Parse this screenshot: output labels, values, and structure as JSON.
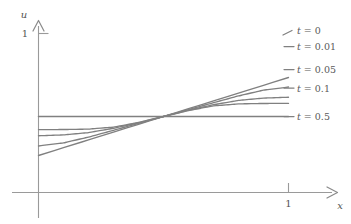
{
  "chart_data": {
    "type": "line",
    "title": "",
    "xlabel": "x",
    "ylabel": "u",
    "xlim": [
      -0.15,
      1.19
    ],
    "ylim": [
      -0.62,
      1.12
    ],
    "grid": false,
    "legend_position": "right-inline",
    "axis_style": "arrow-axes-through-origin",
    "xticks": [
      1
    ],
    "xticklabels": [
      "1"
    ],
    "yticks": [
      1
    ],
    "yticklabels": [
      "1"
    ],
    "line_color": "#808080",
    "axis_color": "#9a9a9a",
    "crossing_point": {
      "x": 0.5,
      "u": 0
    },
    "series": [
      {
        "name": "t = 0",
        "t": 0,
        "label": "t = 0",
        "label_value": "0",
        "shape": "straight-line",
        "x": [
          0.0,
          0.1,
          0.2,
          0.3,
          0.4,
          0.5,
          0.6,
          0.7,
          0.8,
          0.9,
          1.0
        ],
        "values": [
          -0.47,
          -0.375,
          -0.282,
          -0.188,
          -0.094,
          0.0,
          0.094,
          0.188,
          0.282,
          0.375,
          0.47
        ]
      },
      {
        "name": "t = 0.01",
        "t": 0.01,
        "label": "t = 0.01",
        "label_value": "0.01",
        "shape": "sigmoid",
        "x": [
          0.0,
          0.1,
          0.2,
          0.3,
          0.4,
          0.5,
          0.6,
          0.7,
          0.8,
          0.9,
          1.0
        ],
        "values": [
          -0.158,
          -0.157,
          -0.152,
          -0.128,
          -0.072,
          0.0,
          0.072,
          0.128,
          0.152,
          0.157,
          0.158
        ]
      },
      {
        "name": "t = 0.05",
        "t": 0.05,
        "label": "t = 0.05",
        "label_value": "0.05",
        "shape": "sigmoid",
        "x": [
          0.0,
          0.1,
          0.2,
          0.3,
          0.4,
          0.5,
          0.6,
          0.7,
          0.8,
          0.9,
          1.0
        ],
        "values": [
          -0.232,
          -0.222,
          -0.194,
          -0.142,
          -0.076,
          0.0,
          0.076,
          0.142,
          0.194,
          0.222,
          0.232
        ]
      },
      {
        "name": "t = 0.1",
        "t": 0.1,
        "label": "t = 0.1",
        "label_value": "0.1",
        "shape": "sigmoid",
        "x": [
          0.0,
          0.1,
          0.2,
          0.3,
          0.4,
          0.5,
          0.6,
          0.7,
          0.8,
          0.9,
          1.0
        ],
        "values": [
          -0.355,
          -0.318,
          -0.248,
          -0.166,
          -0.083,
          0.0,
          0.083,
          0.166,
          0.248,
          0.318,
          0.355
        ]
      },
      {
        "name": "t = 0.5",
        "t": 0.5,
        "label": "t = 0.5",
        "label_value": "0.5",
        "shape": "flat",
        "x": [
          0.0,
          0.1,
          0.2,
          0.3,
          0.4,
          0.5,
          0.6,
          0.7,
          0.8,
          0.9,
          1.0
        ],
        "values": [
          0.0,
          0.0,
          0.0,
          0.0,
          0.0,
          0.0,
          0.0,
          0.0,
          0.0,
          0.0,
          0.0
        ]
      }
    ]
  },
  "axes": {
    "y_axis_name": "u",
    "x_axis_name": "x",
    "y_tick_1": "1",
    "x_tick_1": "1"
  },
  "legend": {
    "items": [
      {
        "prefix": "t",
        "eq": " = ",
        "value": "0",
        "full": "t = 0"
      },
      {
        "prefix": "t",
        "eq": " = ",
        "value": "0.01",
        "full": "t = 0.01"
      },
      {
        "prefix": "t",
        "eq": " = ",
        "value": "0.05",
        "full": "t = 0.05"
      },
      {
        "prefix": "t",
        "eq": " = ",
        "value": "0.1",
        "full": "t = 0.1"
      },
      {
        "prefix": "t",
        "eq": " = ",
        "value": "0.5",
        "full": "t = 0.5"
      }
    ]
  }
}
